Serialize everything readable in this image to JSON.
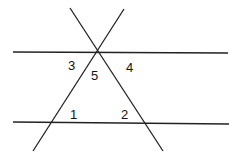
{
  "diagram": {
    "type": "geometry-parallel-lines-transversals",
    "stroke_color": "#222222",
    "lines": [
      {
        "id": "top-parallel",
        "x1": 13,
        "y1": 52,
        "x2": 228,
        "y2": 53
      },
      {
        "id": "bottom-parallel",
        "x1": 13,
        "y1": 122,
        "x2": 229,
        "y2": 124
      },
      {
        "id": "transversal-left",
        "x1": 33,
        "y1": 151,
        "x2": 124,
        "y2": 9
      },
      {
        "id": "transversal-right",
        "x1": 70,
        "y1": 8,
        "x2": 163,
        "y2": 151
      }
    ],
    "labels": [
      {
        "id": "angle-3",
        "text": "3",
        "x": 68,
        "y": 70
      },
      {
        "id": "angle-5",
        "text": "5",
        "x": 91,
        "y": 80
      },
      {
        "id": "angle-4",
        "text": "4",
        "x": 126,
        "y": 72
      },
      {
        "id": "angle-1",
        "text": "1",
        "x": 70,
        "y": 119
      },
      {
        "id": "angle-2",
        "text": "2",
        "x": 121,
        "y": 119
      }
    ]
  }
}
